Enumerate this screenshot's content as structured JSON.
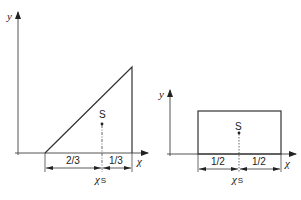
{
  "left_diagram": {
    "shape": "right triangle",
    "y_axis_label": "y",
    "x_axis_label": "χ",
    "centroid_label": "S",
    "segment_left_label": "2/3",
    "segment_right_label": "1/3",
    "centroid_x_label": "χ",
    "centroid_x_subscript": "S"
  },
  "right_diagram": {
    "shape": "rectangle",
    "y_axis_label": "y",
    "x_axis_label": "χ",
    "centroid_label": "S",
    "segment_left_label": "1/2",
    "segment_right_label": "1/2",
    "centroid_x_label": "χ",
    "centroid_x_subscript": "S"
  },
  "colors": {
    "line": "#333333",
    "axis": "#555555",
    "background": "#ffffff"
  }
}
